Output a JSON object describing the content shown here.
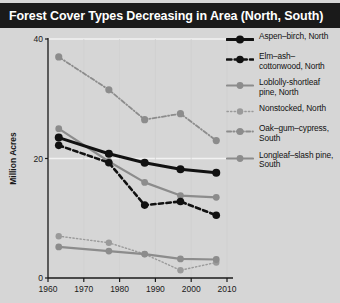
{
  "title": "Forest Cover Types Decreasing in Area (North, South)",
  "axes": {
    "y_title": "Million Acres",
    "y_ticks": [
      "0",
      "20",
      "40"
    ],
    "x_ticks": [
      "1960",
      "1970",
      "1980",
      "1990",
      "2000",
      "2010"
    ]
  },
  "colors": {
    "title_bar": "#1a1a1a",
    "title_text": "#ffffff",
    "background": "#d6d6d6",
    "axis": "#1a1a1a",
    "gridline": "#f2f2f2",
    "black_series": "#111111",
    "gray_series": "#8c8c8c",
    "light_gray_series": "#9a9a9a"
  },
  "legend": {
    "items": [
      {
        "label": "Aspen–birch, North",
        "key": "aspen_birch_north"
      },
      {
        "label": "Elm–ash–cottonwood, North",
        "key": "elm_ash_cottonwood_north"
      },
      {
        "label": "Loblolly-shortleaf pine, North",
        "key": "loblolly_shortleaf_pine_north"
      },
      {
        "label": "Nonstocked, North",
        "key": "nonstocked_north"
      },
      {
        "label": "Oak–gum–cypress, South",
        "key": "oak_gum_cypress_south"
      },
      {
        "label": "Longleaf–slash pine, South",
        "key": "longleaf_slash_pine_south"
      }
    ]
  },
  "chart_data": {
    "type": "line",
    "title": "Forest Cover Types Decreasing in Area (North, South)",
    "xlabel": "",
    "ylabel": "Million Acres",
    "xlim": [
      1960,
      2010
    ],
    "ylim": [
      0,
      40
    ],
    "x_ticks": [
      1960,
      1970,
      1980,
      1990,
      2000,
      2010
    ],
    "y_ticks": [
      0,
      20,
      40
    ],
    "grid": "horizontal-light",
    "legend_position": "right",
    "x": [
      1963,
      1977,
      1987,
      1997,
      2007
    ],
    "series": [
      {
        "name": "Oak–gum–cypress, South",
        "values": [
          37.0,
          31.5,
          26.5,
          27.5,
          23.0
        ],
        "color": "#8c8c8c",
        "style": "dashdot",
        "width": 1.8,
        "marker": 3.6
      },
      {
        "name": "Loblolly-shortleaf pine, North",
        "values": [
          25.0,
          19.5,
          16.0,
          13.8,
          13.5
        ],
        "color": "#8c8c8c",
        "style": "solid",
        "width": 2.2,
        "marker": 3.4
      },
      {
        "name": "Aspen–birch, North",
        "values": [
          23.5,
          20.8,
          19.3,
          18.2,
          17.6
        ],
        "color": "#111111",
        "style": "solid",
        "width": 3.0,
        "marker": 4.0
      },
      {
        "name": "Elm–ash–cottonwood, North",
        "values": [
          22.2,
          19.3,
          12.2,
          12.8,
          10.5
        ],
        "color": "#111111",
        "style": "dashed",
        "width": 2.6,
        "marker": 3.8
      },
      {
        "name": "Nonstocked, North",
        "values": [
          7.0,
          5.9,
          4.0,
          1.3,
          2.6
        ],
        "color": "#9a9a9a",
        "style": "dotted",
        "width": 1.4,
        "marker": 3.2
      },
      {
        "name": "Longleaf–slash pine, South",
        "values": [
          5.2,
          4.5,
          4.0,
          3.2,
          3.1
        ],
        "color": "#8c8c8c",
        "style": "solid",
        "width": 2.2,
        "marker": 3.4
      }
    ]
  }
}
